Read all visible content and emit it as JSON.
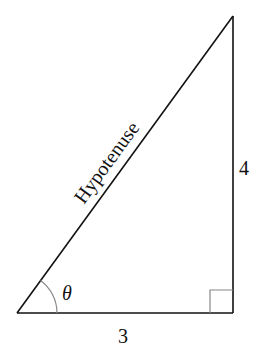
{
  "diagram": {
    "type": "right-triangle",
    "labels": {
      "hypotenuse": "Hypotenuse",
      "vertical_side": "4",
      "horizontal_side": "3",
      "angle": "θ"
    },
    "colors": {
      "stroke": "#111111",
      "angle_marks": "#888888",
      "background": "#ffffff"
    }
  }
}
